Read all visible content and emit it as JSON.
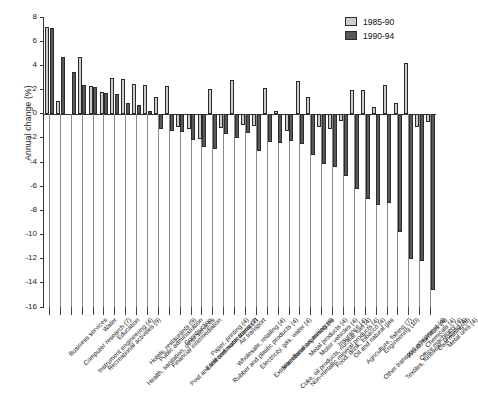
{
  "chart_data": {
    "type": "bar",
    "title": "",
    "subtitle": "",
    "xlabel": "",
    "ylabel": "Annual change (%)",
    "ylim": [
      -16,
      8
    ],
    "ytick_labels": [
      "8",
      "6",
      "4",
      "2",
      "0",
      "-2",
      "-4",
      "-6",
      "-8",
      "-10",
      "-12",
      "-14",
      "-16"
    ],
    "ytick_values": [
      8,
      6,
      4,
      2,
      0,
      -2,
      -4,
      -6,
      -8,
      -10,
      -12,
      -14,
      -16
    ],
    "grid": false,
    "legend_position": "top-right",
    "categories": [
      "Business services",
      "Computer research (7)",
      "Instrument engineering (4)",
      "Recreational activities (9)",
      "Water",
      "Education",
      "Health, sanitation, other services",
      "Hotels, restaurants (9)",
      "Public administration",
      "Financial intermediation",
      "Post and telecommunications (7)",
      "Construction",
      "Land and water transport",
      "Paper, printing (4)",
      "Rubber and plastic products (4)",
      "Wholesale, retailing (4)",
      "Air transport",
      "Electricity, gas, water (4)",
      "Extra-territorial organisations",
      "Miscellaneous mining (6)",
      "Coke, oil products, nuclear fuel (4)",
      "Non-metallic mineral products (4)",
      "Metal products (4)",
      "Motor vehicles (4)",
      "Food, drink, tobacco (4)",
      "Insurance (4)",
      "Oil and natural gas",
      "Agriculture, fishing (7)",
      "Other transport equipment (4)",
      "Engineering (10)",
      "Textiles, footwear, clothing (4)",
      "Wood, furniture (4)",
      "Office machinery (4)",
      "Chemicals (4)",
      "Coal mining (6)",
      "Metal ores (4)"
    ],
    "series": [
      {
        "name": "1985-90",
        "color": "#cdcdcd",
        "values": [
          7.2,
          1.05,
          null,
          4.7,
          2.25,
          1.8,
          2.95,
          2.9,
          2.45,
          2.4,
          1.35,
          2.3,
          -1.1,
          -1.3,
          -2.1,
          2.05,
          -1.2,
          2.75,
          -0.9,
          -1.0,
          2.1,
          0.25,
          -1.4,
          2.7,
          1.4,
          -1.1,
          -1.3,
          -0.6,
          2.0,
          1.95,
          0.55,
          2.35,
          0.85,
          4.2,
          -1.1,
          -0.7
        ]
      },
      {
        "name": "1990-94",
        "color": "#585858",
        "values": [
          7.1,
          4.65,
          3.45,
          2.4,
          2.2,
          1.7,
          1.6,
          0.9,
          0.75,
          0.2,
          -1.3,
          -1.45,
          -1.5,
          -2.15,
          -2.75,
          -2.9,
          -1.65,
          -2.0,
          -1.6,
          -3.05,
          -2.35,
          -2.45,
          -2.3,
          -2.5,
          -3.45,
          -4.2,
          -4.4,
          -5.2,
          -6.2,
          -7.1,
          -7.6,
          -7.4,
          -9.8,
          -12.0,
          -12.2,
          -14.6
        ]
      }
    ]
  },
  "legend": {
    "items": [
      {
        "label": "1985-90",
        "color": "#cdcdcd"
      },
      {
        "label": "1990-94",
        "color": "#585858"
      }
    ]
  },
  "axes": {
    "y_title": "Annual change (%)"
  }
}
